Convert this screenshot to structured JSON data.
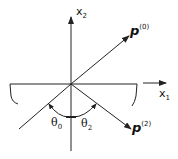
{
  "diagram": {
    "axes": {
      "x1_label": "x",
      "x1_sub": "1",
      "x2_label": "x",
      "x2_sub": "2"
    },
    "vectors": [
      {
        "name": "p",
        "sup": "(0)",
        "description": "incident wave vector"
      },
      {
        "name": "p",
        "sup": "(2)",
        "description": "reflected wave vector"
      }
    ],
    "angles": [
      {
        "name": "θ",
        "sub": "0"
      },
      {
        "name": "θ",
        "sub": "2"
      }
    ],
    "colors": {
      "line": "#222222",
      "background": "#ffffff"
    }
  }
}
